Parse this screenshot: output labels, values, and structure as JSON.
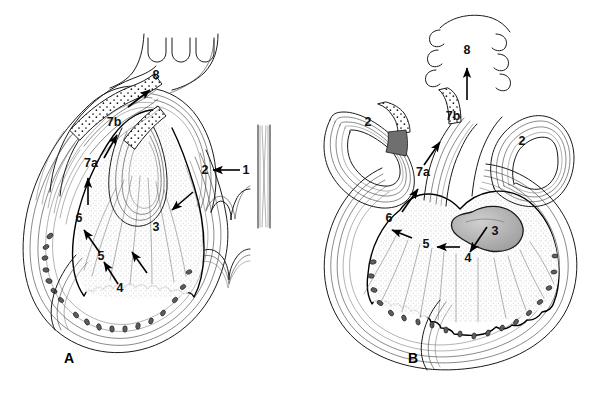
{
  "figure": {
    "background_color": "#ffffff",
    "ink_color": "#1a1a1a",
    "width": 606,
    "height": 394
  },
  "panels": [
    {
      "id": "panel-a",
      "letter": "A",
      "letter_x": 69,
      "letter_y": 363,
      "labels": [
        {
          "key": "a-8",
          "text": "8",
          "x": 160,
          "y": 79
        },
        {
          "key": "a-7b",
          "text": "7b",
          "x": 111,
          "y": 126
        },
        {
          "key": "a-7a",
          "text": "7a",
          "x": 88,
          "y": 167
        },
        {
          "key": "a-2",
          "text": "2",
          "x": 204,
          "y": 174
        },
        {
          "key": "a-1",
          "text": "1",
          "x": 245,
          "y": 174
        },
        {
          "key": "a-3",
          "text": "3",
          "x": 155,
          "y": 231
        },
        {
          "key": "a-6",
          "text": "6",
          "x": 78,
          "y": 222
        },
        {
          "key": "a-5",
          "text": "5",
          "x": 100,
          "y": 260
        },
        {
          "key": "a-4",
          "text": "4",
          "x": 119,
          "y": 292
        }
      ]
    },
    {
      "id": "panel-b",
      "letter": "B",
      "letter_x": 413,
      "letter_y": 363,
      "labels": [
        {
          "key": "b-8",
          "text": "8",
          "x": 466,
          "y": 54
        },
        {
          "key": "b-7b",
          "text": "7b",
          "x": 450,
          "y": 120
        },
        {
          "key": "b-2L",
          "text": "2",
          "x": 367,
          "y": 126
        },
        {
          "key": "b-2R",
          "text": "2",
          "x": 520,
          "y": 145
        },
        {
          "key": "b-7a",
          "text": "7a",
          "x": 420,
          "y": 176
        },
        {
          "key": "b-6",
          "text": "6",
          "x": 388,
          "y": 222
        },
        {
          "key": "b-5",
          "text": "5",
          "x": 425,
          "y": 248
        },
        {
          "key": "b-3",
          "text": "3",
          "x": 494,
          "y": 235
        },
        {
          "key": "b-4",
          "text": "4",
          "x": 467,
          "y": 262
        }
      ]
    }
  ],
  "legend_keys": {
    "note": "Numeric callouts 1-8 with sub-keys 7a and 7b appear on both panels",
    "numbers": [
      "1",
      "2",
      "3",
      "4",
      "5",
      "6",
      "7a",
      "7b",
      "8"
    ]
  }
}
